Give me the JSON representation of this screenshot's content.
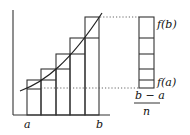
{
  "diagram": {
    "type": "riemann-sum",
    "labels": {
      "a": "a",
      "b": "b",
      "f_b": "f(b)",
      "f_a": "f(a)",
      "fraction_numerator": "b − a",
      "fraction_denominator": "n"
    },
    "rectangles_count": 5,
    "colors": {
      "stroke": "#333333",
      "dotted": "#555555",
      "background": "#ffffff"
    }
  }
}
